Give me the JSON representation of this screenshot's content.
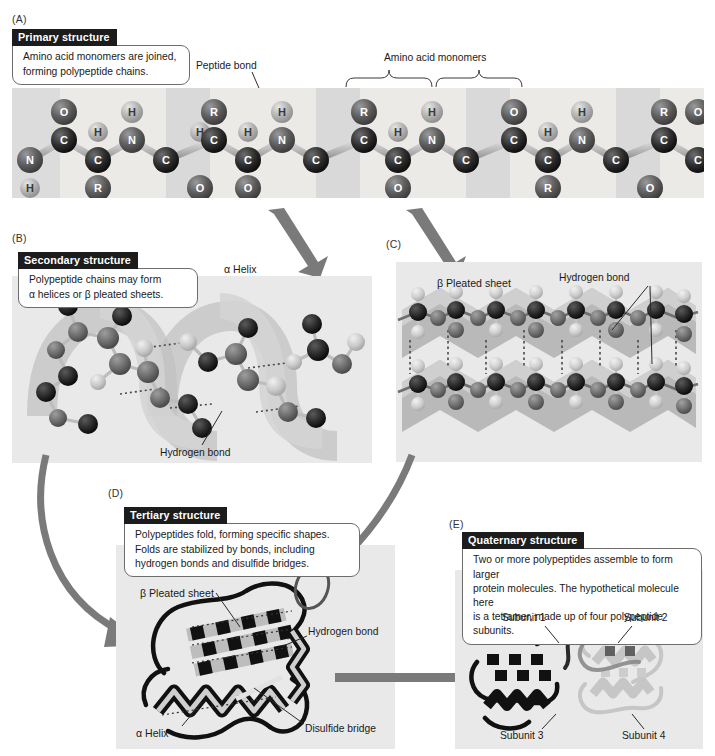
{
  "figure": {
    "accent_dark": "#1c1c1c",
    "arrow_color": "#7a7a7a",
    "panel_bg": "#e9e9e9"
  },
  "panels": {
    "a": {
      "label": "(A)",
      "callout": {
        "tab": "Primary structure",
        "body_line1": "Amino acid monomers are joined,",
        "body_line2": "forming polypeptide chains."
      },
      "annotations": {
        "peptide_bond": "Peptide bond",
        "amino_acid_monomers": "Amino acid monomers"
      },
      "atoms": [
        "O",
        "H",
        "C",
        "N",
        "R"
      ]
    },
    "b": {
      "label": "(B)",
      "callout": {
        "tab": "Secondary structure",
        "body_line1": "Polypeptide chains may form",
        "body_line2": "α helices or β pleated sheets."
      },
      "annotations": {
        "alpha_helix": "α Helix",
        "hydrogen_bond": "Hydrogen bond"
      }
    },
    "c": {
      "label": "(C)",
      "annotations": {
        "beta_pleated_sheet": "β Pleated sheet",
        "hydrogen_bond": "Hydrogen bond"
      }
    },
    "d": {
      "label": "(D)",
      "callout": {
        "tab": "Tertiary structure",
        "body_line1": "Polypeptides fold, forming specific shapes.",
        "body_line2": "Folds are stabilized by bonds, including",
        "body_line3": "hydrogen bonds and disulfide bridges."
      },
      "annotations": {
        "beta_pleated_sheet": "β Pleated sheet",
        "hydrogen_bond": "Hydrogen bond",
        "alpha_helix": "α Helix",
        "disulfide_bridge": "Disulfide bridge"
      }
    },
    "e": {
      "label": "(E)",
      "callout": {
        "tab": "Quaternary structure",
        "body_line1": "Two or more polypeptides assemble to form larger",
        "body_line2": "protein molecules. The hypothetical molecule here",
        "body_line3": "is a tetramer, made up of four polypeptide subunits."
      },
      "annotations": {
        "subunit_1": "Subunit 1",
        "subunit_2": "Subunit 2",
        "subunit_3": "Subunit 3",
        "subunit_4": "Subunit 4"
      }
    }
  }
}
